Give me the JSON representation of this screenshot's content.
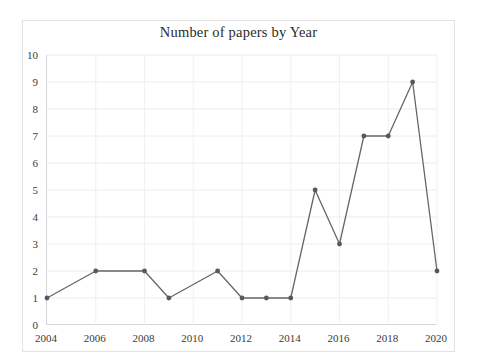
{
  "chart_data": {
    "type": "line",
    "title": "Number of papers by Year",
    "xlabel": "",
    "ylabel": "",
    "xlim": [
      2004,
      2020
    ],
    "ylim": [
      0,
      10
    ],
    "grid": true,
    "legend": false,
    "x": [
      2004,
      2006,
      2008,
      2009,
      2011,
      2012,
      2013,
      2014,
      2015,
      2016,
      2017,
      2018,
      2019,
      2020
    ],
    "values": [
      1,
      2,
      2,
      1,
      2,
      1,
      1,
      1,
      5,
      3,
      7,
      7,
      9,
      2
    ],
    "series": [
      {
        "name": "Number of papers",
        "x": [
          2004,
          2006,
          2008,
          2009,
          2011,
          2012,
          2013,
          2014,
          2015,
          2016,
          2017,
          2018,
          2019,
          2020
        ],
        "values": [
          1,
          2,
          2,
          1,
          2,
          1,
          1,
          1,
          5,
          3,
          7,
          7,
          9,
          2
        ],
        "color": "#63676b",
        "marker": "circle"
      }
    ],
    "y_tick_labels": [
      "0",
      "1",
      "2",
      "3",
      "4",
      "5",
      "6",
      "7",
      "8",
      "9",
      "10"
    ],
    "y_tick_values": [
      0,
      1,
      2,
      3,
      4,
      5,
      6,
      7,
      8,
      9,
      10
    ],
    "x_tick_labels": [
      "2004",
      "2006",
      "2008",
      "2010",
      "2012",
      "2014",
      "2016",
      "2018",
      "2020"
    ],
    "x_tick_values": [
      2004,
      2006,
      2008,
      2010,
      2012,
      2014,
      2016,
      2018,
      2020
    ],
    "colors": {
      "line": "#63676b",
      "marker": "#55595d",
      "grid": "#ececec",
      "axis": "#d6d6d6",
      "text": "#3a3a3a",
      "title": "#2b2b2b",
      "background": "#ffffff",
      "frame": "#e2e2e2"
    }
  }
}
